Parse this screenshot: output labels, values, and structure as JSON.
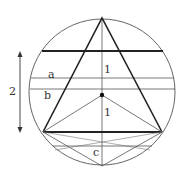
{
  "diagram": {
    "type": "geometry",
    "labels": {
      "dimension": "2",
      "chord_a": "a",
      "chord_b": "b",
      "chord_c": "c",
      "upper_segment": "1",
      "lower_segment": "1"
    },
    "colors": {
      "thin_line": "#555555",
      "thick_line": "#222222",
      "background": "#ffffff"
    },
    "geometry": {
      "circle": {
        "cx": 102,
        "cy": 92,
        "r": 73
      },
      "apex": [
        102,
        18
      ],
      "bottom_left": [
        43,
        132
      ],
      "bottom_right": [
        162,
        132
      ],
      "center_dot": [
        102,
        95
      ],
      "bottom_point": [
        102,
        166
      ],
      "thick_chord_top_y": 51,
      "thick_chord_bottom_y": 132,
      "chord_a_y": 78,
      "chord_b_y": 89,
      "chord_c_y": 146,
      "arrow_x": 20,
      "arrow_top_y": 52,
      "arrow_bottom_y": 132
    }
  }
}
